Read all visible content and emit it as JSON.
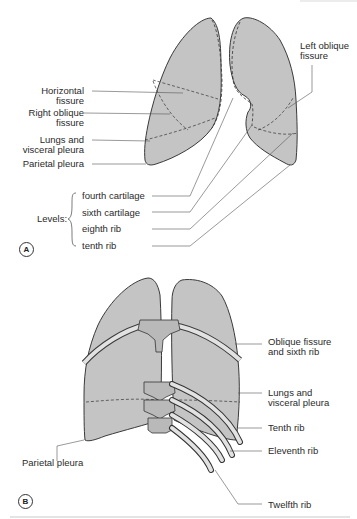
{
  "figure": {
    "panel_a": {
      "badge": "A",
      "labels": {
        "horizontal_fissure_1": "Horizontal",
        "horizontal_fissure_2": "fissure",
        "right_oblique_1": "Right oblique",
        "right_oblique_2": "fissure",
        "lungs_visceral_1": "Lungs and",
        "lungs_visceral_2": "visceral pleura",
        "parietal_pleura": "Parietal pleura",
        "left_oblique_1": "Left oblique",
        "left_oblique_2": "fissure"
      },
      "levels": {
        "title": "Levels:",
        "items": [
          "fourth cartilage",
          "sixth cartilage",
          "eighth rib",
          "tenth rib"
        ]
      }
    },
    "panel_b": {
      "badge": "B",
      "labels": {
        "oblique_sixth_1": "Oblique fissure",
        "oblique_sixth_2": "and sixth rib",
        "lungs_visceral_1": "Lungs and",
        "lungs_visceral_2": "visceral pleura",
        "tenth_rib": "Tenth rib",
        "eleventh_rib": "Eleventh rib",
        "parietal_pleura": "Parietal pleura",
        "twelfth_rib": "Twelfth rib"
      }
    },
    "colors": {
      "lung_fill": "#c4c4c4",
      "lung_shadow": "#adadad",
      "outline": "#3a3a3a",
      "leader": "#555555",
      "bone": "#e2e2e2"
    }
  }
}
